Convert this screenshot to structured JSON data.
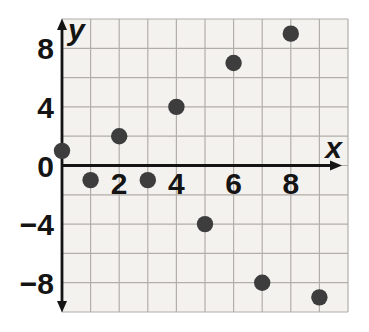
{
  "figure": {
    "background": "#ffffff",
    "plot_background": "#f4f2ef",
    "grid_color": "#b2aeaa",
    "axis_color": "#141414",
    "point_color": "#3d3d3d",
    "label_color": "#141414"
  },
  "chart_data": {
    "type": "scatter",
    "title": "",
    "xlabel": "x",
    "ylabel": "y",
    "xlim": [
      0,
      10
    ],
    "ylim": [
      -10,
      10
    ],
    "x_grid_step": 1,
    "y_grid_step": 2,
    "grid": true,
    "x_ticks": [
      2,
      4,
      6,
      8
    ],
    "y_ticks": [
      8,
      4,
      0,
      -4,
      -8
    ],
    "points": [
      {
        "x": 0,
        "y": 1
      },
      {
        "x": 1,
        "y": -1
      },
      {
        "x": 2,
        "y": 2
      },
      {
        "x": 3,
        "y": -1
      },
      {
        "x": 4,
        "y": 4
      },
      {
        "x": 5,
        "y": -4
      },
      {
        "x": 6,
        "y": 7
      },
      {
        "x": 7,
        "y": -8
      },
      {
        "x": 8,
        "y": 9
      },
      {
        "x": 9,
        "y": -9
      }
    ]
  }
}
